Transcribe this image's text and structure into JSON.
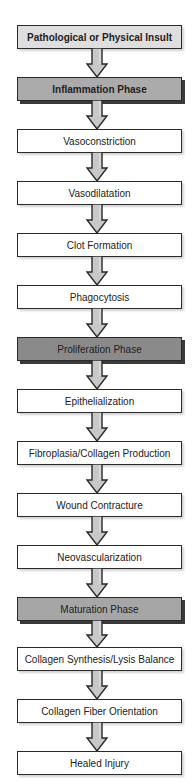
{
  "diagram": {
    "type": "vertical-flowchart",
    "nodes": [
      {
        "id": "n0",
        "label": "Pathological or Physical Insult",
        "kind": "start",
        "top": 25
      },
      {
        "id": "n1",
        "label": "Inflammation Phase",
        "kind": "phase-inflammation",
        "top": 77
      },
      {
        "id": "n2",
        "label": "Vasoconstriction",
        "kind": "plain",
        "top": 129
      },
      {
        "id": "n3",
        "label": "Vasodilatation",
        "kind": "plain",
        "top": 181
      },
      {
        "id": "n4",
        "label": "Clot Formation",
        "kind": "plain",
        "top": 233
      },
      {
        "id": "n5",
        "label": "Phagocytosis",
        "kind": "plain",
        "top": 285
      },
      {
        "id": "n6",
        "label": "Proliferation Phase",
        "kind": "phase-proliferation",
        "top": 337
      },
      {
        "id": "n7",
        "label": "Epithelialization",
        "kind": "plain",
        "top": 389
      },
      {
        "id": "n8",
        "label": "Fibroplasia/Collagen Production",
        "kind": "plain",
        "top": 441
      },
      {
        "id": "n9",
        "label": "Wound Contracture",
        "kind": "plain",
        "top": 493
      },
      {
        "id": "n10",
        "label": "Neovascularization",
        "kind": "plain",
        "top": 545
      },
      {
        "id": "n11",
        "label": "Maturation Phase",
        "kind": "phase-maturation",
        "top": 597
      },
      {
        "id": "n12",
        "label": "Collagen Synthesis/Lysis Balance",
        "kind": "plain",
        "top": 647
      },
      {
        "id": "n13",
        "label": "Collagen Fiber Orientation",
        "kind": "plain",
        "top": 699
      },
      {
        "id": "n14",
        "label": "Healed Injury",
        "kind": "plain",
        "top": 751
      }
    ],
    "edges": [
      [
        "n0",
        "n1"
      ],
      [
        "n1",
        "n2"
      ],
      [
        "n2",
        "n3"
      ],
      [
        "n3",
        "n4"
      ],
      [
        "n4",
        "n5"
      ],
      [
        "n5",
        "n6"
      ],
      [
        "n6",
        "n7"
      ],
      [
        "n7",
        "n8"
      ],
      [
        "n8",
        "n9"
      ],
      [
        "n9",
        "n10"
      ],
      [
        "n10",
        "n11"
      ],
      [
        "n11",
        "n12"
      ],
      [
        "n12",
        "n13"
      ],
      [
        "n13",
        "n14"
      ]
    ],
    "colors": {
      "start_fill": "#dedede",
      "inflammation_fill": "#ababab",
      "proliferation_fill": "#8a8a8a",
      "maturation_fill": "#a6a6a6",
      "plain_fill": "#ffffff",
      "border": "#2a2a2a",
      "arrow_fill": "#c8c8c8"
    }
  }
}
